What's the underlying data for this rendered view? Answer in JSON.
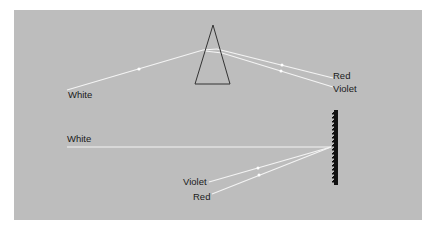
{
  "diagram": {
    "title": "",
    "colors": {
      "background": "#bdbdbd",
      "ray": "#f4f4f4",
      "outline": "#333333",
      "grating": "#111111"
    },
    "prism_section": {
      "component": "prism",
      "labels": {
        "input": "White",
        "output_top": "Red",
        "output_bottom": "Violet"
      }
    },
    "grating_section": {
      "component": "diffraction-grating",
      "labels": {
        "input": "White",
        "output_top": "Violet",
        "output_bottom": "Red"
      }
    }
  }
}
